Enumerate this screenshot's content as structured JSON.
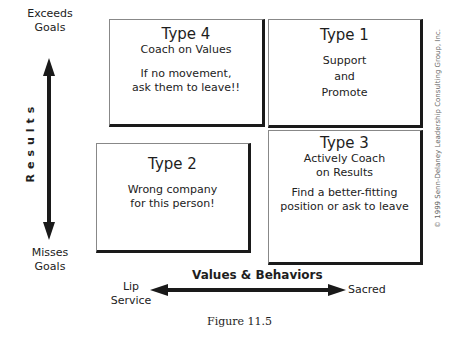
{
  "y_axis": {
    "label": "Results",
    "top_label": [
      "Exceeds",
      "Goals"
    ],
    "bottom_label": [
      "Misses",
      "Goals"
    ]
  },
  "x_axis": {
    "label": "Values & Behaviors",
    "left_label": [
      "Lip",
      "Service"
    ],
    "right_label": "Sacred"
  },
  "quadrants": {
    "type4": {
      "title": "Type 4",
      "lines": [
        "Coach on Values",
        "",
        "If no movement,",
        "ask them to leave!!"
      ]
    },
    "type1": {
      "title": "Type 1",
      "lines": [
        "Support",
        "and",
        "Promote"
      ]
    },
    "type2": {
      "title": "Type 2",
      "lines": [
        "Wrong company",
        "for this person!"
      ]
    },
    "type3": {
      "title": "Type 3",
      "lines": [
        "Actively Coach",
        "on Results",
        "Find a better-fitting",
        "position or ask to leave"
      ]
    }
  },
  "caption": "Figure 11.5",
  "copyright": "© 1999 Senn-Delaney Leadership Consulting Group, Inc.",
  "colors": {
    "ink": "#1a1a1a",
    "border_light": "#888888",
    "copyright": "#666666"
  }
}
